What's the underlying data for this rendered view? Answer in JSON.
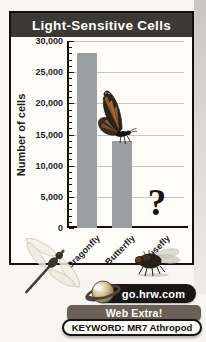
{
  "figure": {
    "title": "Light-Sensitive Cells",
    "colors": {
      "title_bar": "#3b3936",
      "frame_border": "#14110d",
      "bar": "#9aa0a2",
      "gridline": "#c8c6c0",
      "banner": "#6b6057",
      "url_pill": "#191613"
    }
  },
  "chart_data": {
    "type": "bar",
    "title": "Light-Sensitive Cells",
    "ylabel": "Number of cells",
    "xlabel": "",
    "categories": [
      "Dragonfly",
      "Butterfly",
      "Housefly"
    ],
    "values": [
      28000,
      14000,
      null
    ],
    "unknown_marker": "?",
    "ylim": [
      0,
      30000
    ],
    "ytick_interval": 5000,
    "minor_tick_interval": 1000,
    "ytick_labels": [
      "30,000",
      "25,000",
      "20,000",
      "15,000",
      "10,000",
      "5,000",
      "0"
    ],
    "grid": true,
    "legend": false,
    "bar_color": "#9aa0a2",
    "illustrations": [
      "monarch butterfly perched on the Butterfly bar",
      "dragonfly across the lower-left frame corner",
      "housefly at lower right inside the frame",
      "question mark in place of the Housefly bar"
    ]
  },
  "badge": {
    "url": "go.hrw.com",
    "banner": "Web Extra!",
    "keyword": "KEYWORD: MR7 Athropod"
  },
  "icons": {
    "planet": "saturn-icon",
    "butterfly": "butterfly-icon",
    "dragonfly": "dragonfly-icon",
    "housefly": "housefly-icon"
  }
}
